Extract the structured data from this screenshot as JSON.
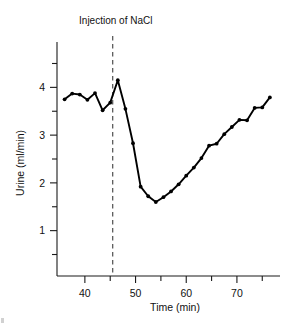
{
  "figure": {
    "annotation": {
      "text": "Injection of NaCl",
      "x_value": 45.5
    },
    "axes": {
      "x": {
        "title": "Time (min)",
        "tick_labels": [
          "40",
          "50",
          "60",
          "70"
        ],
        "tick_values": [
          40,
          50,
          60,
          70
        ],
        "minor_tick_values": [
          45,
          55,
          65,
          75
        ],
        "range": [
          34.5,
          78.5
        ]
      },
      "y": {
        "title": "Urine (ml/min)",
        "tick_labels": [
          "1",
          "2",
          "3",
          "4"
        ],
        "tick_values": [
          1,
          2,
          3,
          4
        ],
        "minor_tick_values": [
          0.5,
          1.5,
          2.5,
          3.5,
          4.5
        ],
        "range": [
          0.05,
          4.95
        ]
      }
    }
  },
  "chart_data": {
    "type": "line",
    "title": "",
    "xlabel": "Time (min)",
    "ylabel": "Urine (ml/min)",
    "xlim": [
      34.5,
      78.5
    ],
    "ylim": [
      0.05,
      4.95
    ],
    "grid": false,
    "legend": null,
    "annotations": [
      {
        "type": "vline",
        "label": "Injection of NaCl",
        "x": 45.5,
        "style": "dashed"
      }
    ],
    "x": [
      36.0,
      37.5,
      39.0,
      40.5,
      42.0,
      43.5,
      45.0,
      46.5,
      48.0,
      49.5,
      51.0,
      52.5,
      54.0,
      55.5,
      57.0,
      58.5,
      60.0,
      61.5,
      63.0,
      64.5,
      66.0,
      67.5,
      69.0,
      70.5,
      72.0,
      73.5,
      75.0,
      76.5
    ],
    "values": [
      3.75,
      3.87,
      3.85,
      3.74,
      3.88,
      3.52,
      3.68,
      4.15,
      3.55,
      2.83,
      1.92,
      1.72,
      1.6,
      1.7,
      1.82,
      1.97,
      2.15,
      2.32,
      2.52,
      2.78,
      2.82,
      3.02,
      3.17,
      3.32,
      3.31,
      3.57,
      3.58,
      3.79
    ],
    "series": [
      {
        "name": "Urine flow rate",
        "color": "#000000",
        "marker": "dot",
        "values": [
          3.75,
          3.87,
          3.85,
          3.74,
          3.88,
          3.52,
          3.68,
          4.15,
          3.55,
          2.83,
          1.92,
          1.72,
          1.6,
          1.7,
          1.82,
          1.97,
          2.15,
          2.32,
          2.52,
          2.78,
          2.82,
          3.02,
          3.17,
          3.32,
          3.31,
          3.57,
          3.58,
          3.79
        ]
      }
    ]
  }
}
